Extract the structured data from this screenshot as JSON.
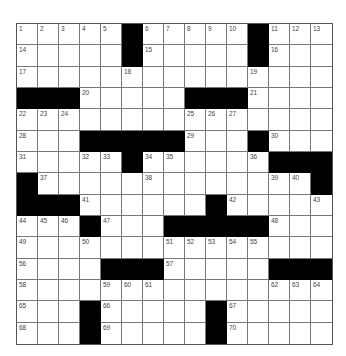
{
  "puzzle": {
    "rows": 15,
    "cols": 15,
    "grid": [
      [
        "1",
        "2",
        "3",
        "4",
        "5",
        "#",
        "6",
        "7",
        "8",
        "9",
        "10",
        "#",
        "11",
        "12",
        "13"
      ],
      [
        "14",
        "",
        "",
        "",
        "",
        "#",
        "15",
        "",
        "",
        "",
        "",
        "#",
        "16",
        "",
        ""
      ],
      [
        "17",
        "",
        "",
        "",
        "",
        "18",
        "",
        "",
        "",
        "",
        "",
        "19",
        "",
        "",
        ""
      ],
      [
        "#",
        "#",
        "#",
        "20",
        "",
        "",
        "",
        "",
        "#",
        "#",
        "#",
        "21",
        "",
        "",
        ""
      ],
      [
        "22",
        "23",
        "24",
        "",
        "",
        "",
        "",
        "",
        "25",
        "26",
        "27",
        "",
        "",
        "",
        ""
      ],
      [
        "28",
        "",
        "",
        "#",
        "#",
        "#",
        "#",
        "#",
        "29",
        "",
        "",
        "#",
        "30",
        "",
        ""
      ],
      [
        "31",
        "",
        "",
        "32",
        "33",
        "#",
        "34",
        "35",
        "",
        "",
        "",
        "36",
        "#",
        "#",
        "#"
      ],
      [
        "#",
        "37",
        "",
        "",
        "",
        "",
        "38",
        "",
        "",
        "",
        "",
        "",
        "39",
        "40",
        "#"
      ],
      [
        "#",
        "#",
        "#",
        "41",
        "",
        "",
        "",
        "",
        "",
        "#",
        "42",
        "",
        "",
        "",
        "43"
      ],
      [
        "44",
        "45",
        "46",
        "#",
        "47",
        "",
        "",
        "#",
        "#",
        "#",
        "#",
        "#",
        "48",
        "",
        ""
      ],
      [
        "49",
        "",
        "",
        "50",
        "",
        "",
        "",
        "51",
        "52",
        "53",
        "54",
        "55",
        "",
        "",
        ""
      ],
      [
        "56",
        "",
        "",
        "",
        "#",
        "#",
        "#",
        "57",
        "",
        "",
        "",
        "",
        "#",
        "#",
        "#"
      ],
      [
        "58",
        "",
        "",
        "",
        "59",
        "60",
        "61",
        "",
        "",
        "",
        "",
        "",
        "62",
        "63",
        "64"
      ],
      [
        "65",
        "",
        "",
        "#",
        "66",
        "",
        "",
        "",
        "",
        "#",
        "67",
        "",
        "",
        "",
        ""
      ],
      [
        "68",
        "",
        "",
        "#",
        "69",
        "",
        "",
        "",
        "",
        "#",
        "70",
        "",
        "",
        "",
        ""
      ]
    ]
  }
}
